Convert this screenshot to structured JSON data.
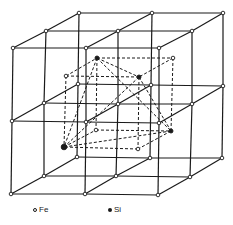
{
  "diagram": {
    "title": "",
    "colors": {
      "line": "#1a1a1a",
      "background": "#ffffff"
    },
    "outer_nodes": [
      [
        79,
        13
      ],
      [
        152,
        13
      ],
      [
        223,
        13
      ],
      [
        46,
        31
      ],
      [
        118,
        31
      ],
      [
        192,
        31
      ],
      [
        13,
        48
      ],
      [
        86,
        48
      ],
      [
        159,
        48
      ],
      [
        78,
        84
      ],
      [
        151,
        85
      ],
      [
        223,
        86
      ],
      [
        44,
        103
      ],
      [
        118,
        104
      ],
      [
        192,
        104
      ],
      [
        12,
        121
      ],
      [
        86,
        122
      ],
      [
        159,
        123
      ],
      [
        77,
        157
      ],
      [
        150,
        158
      ],
      [
        222,
        158
      ],
      [
        44,
        176
      ],
      [
        116,
        176
      ],
      [
        190,
        177
      ],
      [
        11,
        194
      ],
      [
        85,
        194
      ],
      [
        158,
        195
      ]
    ],
    "inner_fe": [
      [
        66,
        76
      ],
      [
        173,
        58
      ],
      [
        96,
        130
      ],
      [
        138,
        149
      ]
    ],
    "inner_si": [
      [
        97,
        58
      ],
      [
        139,
        77
      ],
      [
        171,
        131
      ],
      [
        64,
        147
      ]
    ]
  },
  "legend": {
    "items": [
      {
        "symbol": "open-circle",
        "label": "Fe"
      },
      {
        "symbol": "filled-circle",
        "label": "Si"
      }
    ]
  }
}
